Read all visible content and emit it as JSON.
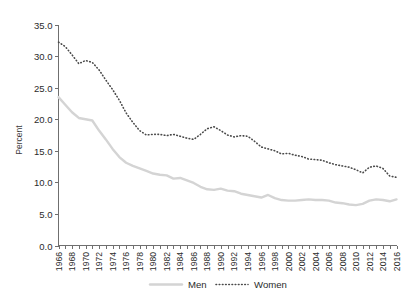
{
  "chart_data": {
    "type": "line",
    "title": "",
    "subtitle": "",
    "xlabel": "",
    "ylabel": "Percent",
    "ylim": [
      0.0,
      35.0
    ],
    "xlim": [
      1966,
      2016
    ],
    "grid": false,
    "legend_position": "bottom",
    "ytick_labels": [
      "0.0",
      "5.0",
      "10.0",
      "15.0",
      "20.0",
      "25.0",
      "30.0",
      "35.0"
    ],
    "ytick_values": [
      0.0,
      5.0,
      10.0,
      15.0,
      20.0,
      25.0,
      30.0,
      35.0
    ],
    "xtick_labels": [
      "1966",
      "1968",
      "1970",
      "1972",
      "1974",
      "1976",
      "1978",
      "1980",
      "1982",
      "1984",
      "1986",
      "1988",
      "1990",
      "1992",
      "1994",
      "1996",
      "1998",
      "2000",
      "2002",
      "2004",
      "2006",
      "2008",
      "2010",
      "2012",
      "2014",
      "2016"
    ],
    "x": [
      1966,
      1967,
      1968,
      1969,
      1970,
      1971,
      1972,
      1973,
      1974,
      1975,
      1976,
      1977,
      1978,
      1979,
      1980,
      1981,
      1982,
      1983,
      1984,
      1985,
      1986,
      1987,
      1988,
      1989,
      1990,
      1991,
      1992,
      1993,
      1994,
      1995,
      1996,
      1997,
      1998,
      1999,
      2000,
      2001,
      2002,
      2003,
      2004,
      2005,
      2006,
      2007,
      2008,
      2009,
      2010,
      2011,
      2012,
      2013,
      2014,
      2015,
      2016
    ],
    "series": [
      {
        "name": "Men",
        "style": "solid",
        "color": "#d4d4d4",
        "values": [
          23.5,
          22.3,
          21.1,
          20.2,
          20.0,
          19.8,
          18.2,
          16.8,
          15.3,
          14.0,
          13.1,
          12.6,
          12.2,
          11.8,
          11.4,
          11.2,
          11.1,
          10.6,
          10.7,
          10.3,
          9.9,
          9.3,
          8.9,
          8.8,
          9.0,
          8.7,
          8.6,
          8.2,
          8.0,
          7.8,
          7.6,
          8.0,
          7.5,
          7.2,
          7.1,
          7.1,
          7.2,
          7.3,
          7.2,
          7.2,
          7.1,
          6.8,
          6.7,
          6.5,
          6.4,
          6.6,
          7.1,
          7.3,
          7.2,
          7.0,
          7.3
        ]
      },
      {
        "name": "Women",
        "style": "dotted",
        "color": "#4a4a4a",
        "values": [
          32.2,
          31.5,
          30.2,
          28.8,
          29.3,
          29.0,
          27.8,
          26.2,
          24.7,
          23.0,
          21.0,
          19.5,
          18.2,
          17.5,
          17.6,
          17.6,
          17.4,
          17.6,
          17.3,
          17.0,
          16.8,
          17.6,
          18.5,
          18.8,
          18.2,
          17.5,
          17.2,
          17.4,
          17.3,
          16.5,
          15.6,
          15.3,
          15.0,
          14.5,
          14.6,
          14.3,
          14.1,
          13.7,
          13.6,
          13.5,
          13.1,
          12.8,
          12.6,
          12.4,
          12.0,
          11.5,
          12.4,
          12.6,
          12.2,
          11.0,
          10.8
        ]
      }
    ]
  },
  "legend": {
    "entries": [
      {
        "label": "Men"
      },
      {
        "label": "Women"
      }
    ]
  },
  "axis": {
    "ylabel": "Percent"
  },
  "colors": {
    "men": "#d4d4d4",
    "women": "#4a4a4a",
    "axis": "#6f6f6f",
    "text": "#2b2b2b",
    "background": "#ffffff"
  }
}
